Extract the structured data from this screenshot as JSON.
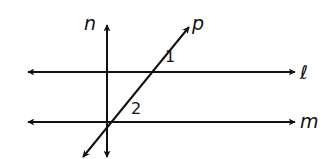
{
  "diagram": {
    "title": "",
    "colors": {
      "stroke": "#111111",
      "background": "#ffffff"
    },
    "lines": [
      {
        "id": "l",
        "label": "ℓ",
        "kind": "horizontal",
        "from": [
          28,
          72
        ],
        "to": [
          295,
          72
        ],
        "arrows": "both",
        "label_pos": [
          300,
          79
        ]
      },
      {
        "id": "m",
        "label": "m",
        "kind": "horizontal",
        "from": [
          28,
          122
        ],
        "to": [
          295,
          122
        ],
        "arrows": "both",
        "label_pos": [
          300,
          128
        ]
      },
      {
        "id": "n",
        "label": "n",
        "kind": "vertical",
        "from": [
          107,
          157
        ],
        "to": [
          107,
          25
        ],
        "arrows": "both",
        "label_pos": [
          84,
          30
        ]
      },
      {
        "id": "p",
        "label": "p",
        "kind": "transversal",
        "from": [
          83,
          157
        ],
        "to": [
          189,
          27
        ],
        "arrows": "both",
        "label_pos": [
          192,
          30
        ]
      }
    ],
    "angles": [
      {
        "label": "1",
        "pos": [
          165,
          62
        ],
        "between": "p and ℓ"
      },
      {
        "label": "2",
        "pos": [
          131,
          114
        ],
        "between": "p and m"
      }
    ]
  }
}
